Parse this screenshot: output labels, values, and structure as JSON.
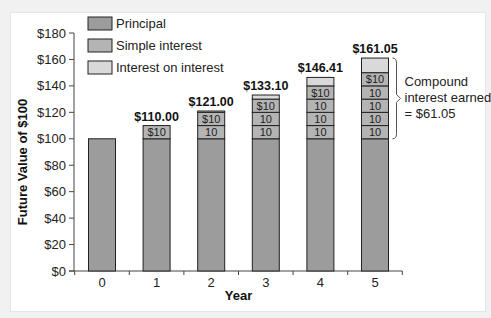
{
  "chart_data": {
    "type": "bar",
    "stacked": true,
    "title": "",
    "xlabel": "Year",
    "ylabel": "Future Value of  $100",
    "ylim": [
      0,
      180
    ],
    "yticks": [
      0,
      20,
      40,
      60,
      80,
      100,
      120,
      140,
      160,
      180
    ],
    "ytick_labels": [
      "$0",
      "$20",
      "$40",
      "$60",
      "$80",
      "$100",
      "$120",
      "$140",
      "$160",
      "$180"
    ],
    "categories": [
      "0",
      "1",
      "2",
      "3",
      "4",
      "5"
    ],
    "series": [
      {
        "name": "Principal",
        "color": "#9c9c9c",
        "values": [
          100,
          100,
          100,
          100,
          100,
          100
        ]
      },
      {
        "name": "Simple interest",
        "color": "#b4b4b4",
        "values": [
          0,
          10,
          20,
          30,
          40,
          50
        ]
      },
      {
        "name": "Interest on interest",
        "color": "#d9d9d9",
        "values": [
          0,
          0,
          1.0,
          3.1,
          6.41,
          11.05
        ]
      }
    ],
    "totals": [
      100,
      110.0,
      121.0,
      133.1,
      146.41,
      161.05
    ],
    "total_labels": [
      "",
      "$110.00",
      "$121.00",
      "$133.10",
      "$146.41",
      "$161.05"
    ],
    "segment_labels": [
      [],
      [
        "$10"
      ],
      [
        "10",
        "$10"
      ],
      [
        "10",
        "10",
        "$10"
      ],
      [
        "10",
        "10",
        "10",
        "$10"
      ],
      [
        "10",
        "10",
        "10",
        "10",
        "$10"
      ]
    ],
    "legend": {
      "position": "upper-left",
      "entries": [
        "Principal",
        "Simple interest",
        "Interest on interest"
      ]
    },
    "annotation": {
      "lines": [
        "Compound",
        "interest earned",
        "= $61.05"
      ],
      "bracket_target": "year 5 interest"
    },
    "grid": false
  }
}
